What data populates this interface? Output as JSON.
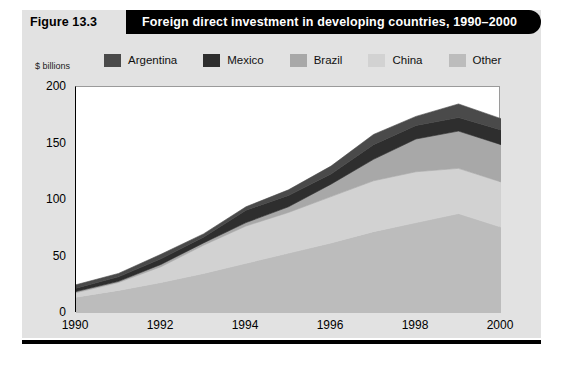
{
  "figure": {
    "number_label": "Figure 13.3",
    "title": "Foreign direct investment in developing countries, 1990–2000"
  },
  "axis_note": "$ billions",
  "colors": {
    "argentina": "#4a4a4a",
    "mexico": "#2e2e2e",
    "brazil": "#a8a8a8",
    "china": "#d2d2d2",
    "other": "#bcbcbc",
    "panel_background": "#e2e2e2",
    "plot_background": "#ffffff",
    "title_bar": "#000000",
    "title_text": "#ffffff"
  },
  "legend": {
    "items": [
      {
        "label": "Argentina",
        "color": "#4a4a4a"
      },
      {
        "label": "Mexico",
        "color": "#2e2e2e"
      },
      {
        "label": "Brazil",
        "color": "#a8a8a8"
      },
      {
        "label": "China",
        "color": "#d2d2d2"
      },
      {
        "label": "Other",
        "color": "#bcbcbc"
      }
    ]
  },
  "yticks": [
    "200",
    "150",
    "100",
    "50",
    "0"
  ],
  "xticks": [
    "1990",
    "1992",
    "1994",
    "1996",
    "1998",
    "2000"
  ],
  "chart_data": {
    "type": "area",
    "stacked": true,
    "title": "Foreign direct investment in developing countries, 1990–2000",
    "xlabel": "",
    "ylabel": "$ billions",
    "ylim": [
      0,
      200
    ],
    "xlim": [
      1990,
      2000
    ],
    "grid": false,
    "legend_position": "top",
    "x": [
      1990,
      1991,
      1992,
      1993,
      1994,
      1995,
      1996,
      1997,
      1998,
      1999,
      2000
    ],
    "stack_order_bottom_to_top": [
      "Other",
      "China",
      "Brazil",
      "Mexico",
      "Argentina"
    ],
    "series": [
      {
        "name": "Other",
        "color": "#bcbcbc",
        "values": [
          14,
          20,
          27,
          35,
          44,
          53,
          62,
          72,
          80,
          88,
          76
        ]
      },
      {
        "name": "China",
        "color": "#d2d2d2",
        "values": [
          4,
          7,
          14,
          25,
          33,
          36,
          41,
          45,
          45,
          40,
          40
        ]
      },
      {
        "name": "Brazil",
        "color": "#a8a8a8",
        "values": [
          1,
          1,
          2,
          2,
          3,
          5,
          11,
          19,
          29,
          33,
          33
        ]
      },
      {
        "name": "Mexico",
        "color": "#2e2e2e",
        "values": [
          3,
          4,
          5,
          5,
          11,
          10,
          9,
          13,
          12,
          12,
          13
        ]
      },
      {
        "name": "Argentina",
        "color": "#4a4a4a",
        "values": [
          3,
          3,
          4,
          3,
          3,
          5,
          7,
          9,
          8,
          12,
          10
        ]
      }
    ],
    "totals": [
      25,
      35,
      52,
      70,
      94,
      109,
      130,
      158,
      174,
      185,
      172
    ]
  }
}
